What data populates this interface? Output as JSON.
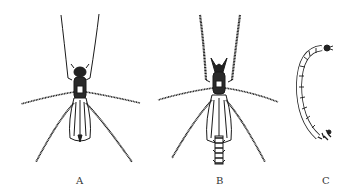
{
  "figure": {
    "panels": [
      {
        "id": "A",
        "label": "A",
        "subject": "adult insect (female midge), dorsal view"
      },
      {
        "id": "B",
        "label": "B",
        "subject": "adult insect (male midge with plumose antennae), dorsal view"
      },
      {
        "id": "C",
        "label": "C",
        "subject": "larva, segmented, curved"
      }
    ],
    "colors": {
      "ink": "#1a1a1a",
      "background": "#ffffff"
    }
  }
}
